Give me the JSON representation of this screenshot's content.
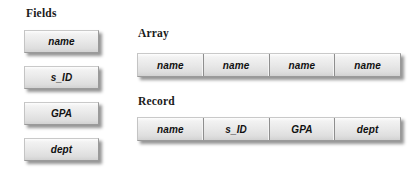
{
  "figure": {
    "background_color": "#ffffff",
    "plate_fill": "#e9e9e9",
    "plate_border": "#9a9a9a",
    "text_color": "#111111"
  },
  "fields_section": {
    "heading": "Fields",
    "items": [
      {
        "label": "name"
      },
      {
        "label": "s_ID"
      },
      {
        "label": "GPA"
      },
      {
        "label": "dept"
      }
    ]
  },
  "array_section": {
    "heading": "Array",
    "cells": [
      {
        "label": "name"
      },
      {
        "label": "name"
      },
      {
        "label": "name"
      },
      {
        "label": "name"
      }
    ]
  },
  "record_section": {
    "heading": "Record",
    "cells": [
      {
        "label": "name"
      },
      {
        "label": "s_ID"
      },
      {
        "label": "GPA"
      },
      {
        "label": "dept"
      }
    ]
  }
}
